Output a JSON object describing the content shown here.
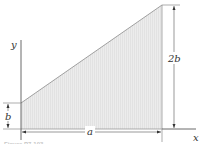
{
  "figure": {
    "shape": "trapezoid",
    "labels": {
      "y_axis": "y",
      "x_axis": "x",
      "left_height": "b",
      "right_height": "2b",
      "width": "a"
    },
    "caption": "Figure P7-103",
    "colors": {
      "fill": "#ebebeb",
      "hatch": "#d8d8d8",
      "edge": "#8a8a8a",
      "dimension": "#555555",
      "axis": "#444444"
    }
  }
}
